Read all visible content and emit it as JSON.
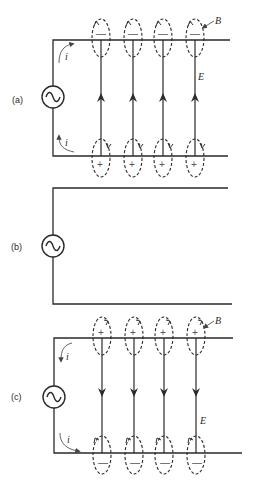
{
  "figure": {
    "panels": [
      {
        "id": "a",
        "label": "(a)",
        "current_label": "i",
        "field_label": "E",
        "magnetic_label": "B",
        "top_charge": "—",
        "bottom_charge": "+",
        "field_direction": "up"
      },
      {
        "id": "b",
        "label": "(b)"
      },
      {
        "id": "c",
        "label": "(c)",
        "current_label": "i",
        "field_label": "E",
        "magnetic_label": "B",
        "top_charge": "+",
        "bottom_charge": "—",
        "field_direction": "down"
      }
    ],
    "field_line_count": 4,
    "source_symbol": "~"
  }
}
